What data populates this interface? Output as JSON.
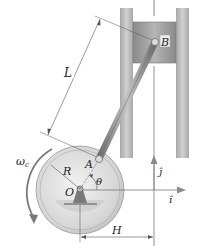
{
  "labels": {
    "B": "B",
    "L": "L",
    "A": "A",
    "R": "R",
    "O": "O",
    "theta": "θ",
    "omega": "ω",
    "omega_sub": "c",
    "H": "H",
    "j_hat": "ĵ",
    "i_hat": "î"
  },
  "colors": {
    "wall": "#b9b9b9",
    "piston": "#9d9d9d",
    "rod": "#8f8f8f",
    "disk": "#dcdcdc",
    "line": "#555555"
  }
}
